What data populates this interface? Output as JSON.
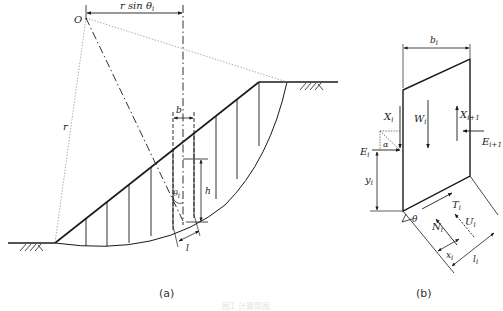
{
  "figure": {
    "panel_a": {
      "caption": "(a)",
      "labels": {
        "center": "O",
        "radius": "r",
        "horizontal_offset": "r sin θ",
        "horizontal_offset_sub": "i",
        "slice_width": "b",
        "slice_height": "h",
        "base_angle": "θ",
        "base_angle_sub": "i",
        "base_length": "l"
      },
      "slice_count": 9
    },
    "panel_b": {
      "caption": "(b)",
      "labels": {
        "width": "b",
        "width_sub": "i",
        "weight": "W",
        "weight_sub": "i",
        "shear_left": "X",
        "shear_left_sub": "i",
        "shear_right": "X",
        "shear_right_sub": "i+1",
        "normal_left": "E",
        "normal_left_sub": "i",
        "normal_right": "E",
        "normal_right_sub": "i+1",
        "angle_alpha": "α",
        "height_y": "y",
        "height_y_sub": "i",
        "base_angle": "θ",
        "shear_force": "T",
        "shear_force_sub": "i",
        "normal_force": "N",
        "normal_force_sub": "i",
        "pore_pressure": "U",
        "pore_pressure_sub": "i",
        "lever_x": "x",
        "lever_x_sub": "i",
        "base_length": "l",
        "base_length_sub": "i"
      }
    },
    "caption": "图1 计算简图"
  },
  "colors": {
    "line": "#1a1a1a",
    "dotted": "#999999",
    "caption_faded": "#e4e4e4"
  }
}
